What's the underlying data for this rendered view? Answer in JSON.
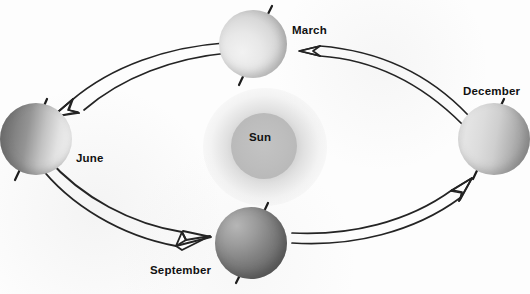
{
  "diagram": {
    "center": {
      "label": "Sun",
      "name": "sun"
    },
    "positions": [
      {
        "label": "March",
        "name": "earth-march"
      },
      {
        "label": "June",
        "name": "earth-june"
      },
      {
        "label": "September",
        "name": "earth-september"
      },
      {
        "label": "December",
        "name": "earth-december"
      }
    ],
    "arrows": [
      {
        "name": "arrow-march-to-june",
        "from": "March",
        "to": "June"
      },
      {
        "name": "arrow-june-to-september",
        "from": "June",
        "to": "September"
      },
      {
        "name": "arrow-september-to-december",
        "from": "September",
        "to": "December"
      },
      {
        "name": "arrow-december-to-march",
        "from": "December",
        "to": "March"
      }
    ],
    "colors": {
      "background": "#fdfdfd",
      "ink": "#1a1a1a",
      "sun_core": "#b9b9b9",
      "planet_light": "#efefef",
      "planet_dark": "#5c5c5c"
    }
  }
}
